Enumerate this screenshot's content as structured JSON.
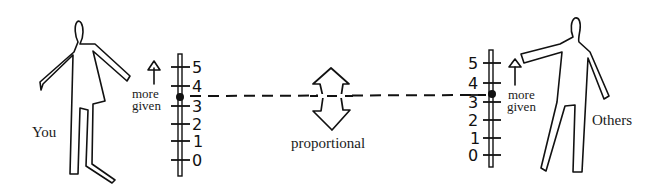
{
  "diagram": {
    "type": "proportional-giving-scales",
    "left": {
      "figure_label": "You",
      "annotation": [
        "more",
        "given"
      ],
      "scale_ticks": [
        "0",
        "1",
        "2",
        "3",
        "4",
        "5"
      ],
      "marker_value": 3.5
    },
    "right": {
      "figure_label": "Others",
      "annotation": [
        "more",
        "given"
      ],
      "scale_ticks": [
        "0",
        "1",
        "2",
        "3",
        "4",
        "5"
      ],
      "marker_value": 3.5
    },
    "center": {
      "label": "proportional",
      "connector": "dashed-line",
      "icon": "double-headed-vertical-arrow"
    },
    "colors": {
      "ink": "#111111",
      "background": "#ffffff"
    }
  }
}
